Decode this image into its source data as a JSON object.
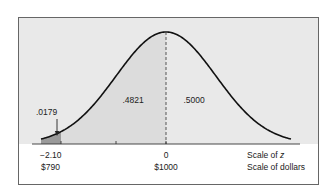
{
  "chart_data": {
    "type": "area",
    "title": "",
    "distribution": "standard normal",
    "mean": 0,
    "sd": 1,
    "xlim": [
      -3,
      3
    ],
    "ticks_z": [
      -2.1,
      -1,
      0
    ],
    "tick_labels": {
      "z": [
        "−2.10",
        "0"
      ],
      "dollars": [
        "$790",
        "$1000"
      ]
    },
    "tick_label_positions_z": [
      -2.1,
      0
    ],
    "axis_scale_labels": [
      "Scale of ",
      "Scale of dollars"
    ],
    "axis_scale_italic": "z",
    "regions": [
      {
        "name": "left-tail",
        "from_z": -3,
        "to_z": -2.1,
        "area": ".0179",
        "shade": "dark"
      },
      {
        "name": "middle-left",
        "from_z": -2.1,
        "to_z": 0,
        "area": ".4821",
        "shade": "light"
      },
      {
        "name": "right-half",
        "from_z": 0,
        "to_z": 3,
        "area": ".5000",
        "shade": "none"
      }
    ],
    "annotations": [
      {
        "text": ".0179",
        "z": -2.2,
        "arrow": true
      },
      {
        "text": ".4821",
        "z": -0.65
      },
      {
        "text": ".5000",
        "z": 0.55
      }
    ],
    "mean_line": {
      "z": 0,
      "style": "dashed"
    },
    "dollar_mapping": {
      "mean": 1000,
      "sd": 100
    }
  },
  "colors": {
    "background": "#e9e9e9",
    "frame": "#666666",
    "curve": "#111111",
    "light_shade": "#dcdcdc",
    "dark_shade": "#9a9a9a"
  }
}
